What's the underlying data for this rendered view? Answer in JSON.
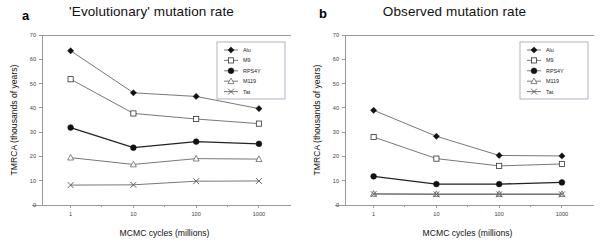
{
  "figure": {
    "width": 606,
    "height": 249,
    "background": "#ffffff"
  },
  "panels": [
    {
      "label": "a",
      "title": "'Evolutionary' mutation rate"
    },
    {
      "label": "b",
      "title": "Observed mutation rate"
    }
  ],
  "chart_data": [
    {
      "type": "line",
      "title": "'Evolutionary' mutation rate",
      "panel": "a",
      "xlabel": "MCMC cycles (millions)",
      "ylabel": "TMRCA (thousands of years)",
      "x_scale": "log",
      "x": [
        1,
        10,
        100,
        1000
      ],
      "categories": [
        "1",
        "10",
        "100",
        "1000"
      ],
      "xticklabels": [
        "1",
        "10",
        "100",
        "1000"
      ],
      "yticklabels": [
        "0",
        "10",
        "20",
        "30",
        "40",
        "50",
        "60",
        "70"
      ],
      "ylim": [
        0,
        70
      ],
      "ytick_step": 10,
      "grid": false,
      "legend_position": "top-right",
      "series": [
        {
          "name": "Alu",
          "marker": "filled-diamond",
          "values": [
            63.5,
            46.2,
            44.7,
            39.7
          ]
        },
        {
          "name": "M9",
          "marker": "open-square",
          "values": [
            51.8,
            37.7,
            35.4,
            33.5
          ]
        },
        {
          "name": "RPS4Y",
          "marker": "filled-circle",
          "values": [
            31.9,
            23.6,
            26.1,
            25.2
          ]
        },
        {
          "name": "M119",
          "marker": "open-triangle",
          "values": [
            19.5,
            16.7,
            19.1,
            18.9
          ]
        },
        {
          "name": "Tat",
          "marker": "x",
          "values": [
            8.2,
            8.3,
            9.8,
            9.9
          ]
        }
      ]
    },
    {
      "type": "line",
      "title": "Observed mutation rate",
      "panel": "b",
      "xlabel": "MCMC cycles (millions)",
      "ylabel": "TMRCA (thousands of years)",
      "x_scale": "log",
      "x": [
        1,
        10,
        100,
        1000
      ],
      "categories": [
        "1",
        "10",
        "100",
        "1000"
      ],
      "xticklabels": [
        "1",
        "10",
        "100",
        "1000"
      ],
      "yticklabels": [
        "0",
        "10",
        "20",
        "30",
        "40",
        "50",
        "60",
        "70"
      ],
      "ylim": [
        0,
        70
      ],
      "ytick_step": 10,
      "grid": false,
      "legend_position": "top-right",
      "series": [
        {
          "name": "Alu",
          "marker": "filled-diamond",
          "values": [
            39.0,
            28.3,
            20.4,
            20.2
          ]
        },
        {
          "name": "M9",
          "marker": "open-square",
          "values": [
            28.0,
            19.1,
            16.1,
            16.9
          ]
        },
        {
          "name": "RPS4Y",
          "marker": "filled-circle",
          "values": [
            11.8,
            8.6,
            8.6,
            9.3
          ]
        },
        {
          "name": "M119",
          "marker": "open-triangle",
          "values": [
            4.6,
            4.5,
            4.5,
            4.5
          ]
        },
        {
          "name": "Tat",
          "marker": "x",
          "values": [
            4.5,
            4.4,
            4.4,
            4.4
          ]
        }
      ]
    }
  ]
}
